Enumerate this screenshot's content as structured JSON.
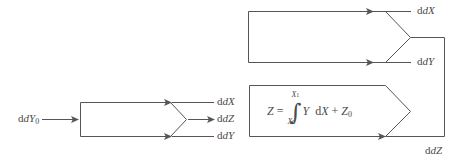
{
  "figure": {
    "stroke_color": "#555555",
    "text_color": "#4a4a4a",
    "background_color": "#ffffff",
    "left_block": {
      "input_label": "dY",
      "input_label_sub": "0",
      "output_labels": [
        "dX",
        "dZ",
        "dY"
      ]
    },
    "top_right_block": {
      "input_labels": [
        "dX",
        "dY"
      ]
    },
    "bottom_right_block": {
      "output_label": "dZ",
      "formula": {
        "lhs": "Z",
        "equals": "=",
        "integral_upper": "X",
        "integral_upper_sub": "1",
        "integral_lower": "X",
        "integral_lower_sub": "0",
        "integrand": "Y",
        "differential": "dX",
        "plus": "+",
        "constant": "Z",
        "constant_sub": "0"
      }
    }
  }
}
